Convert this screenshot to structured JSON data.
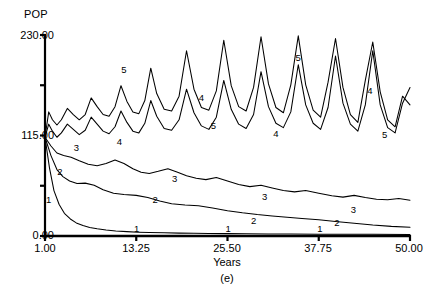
{
  "chart_data": {
    "type": "line",
    "title": "",
    "xlabel": "Years",
    "ylabel": "POP",
    "caption": "(e)",
    "xlim": [
      1.0,
      50.0
    ],
    "ylim": [
      0.0,
      230.0
    ],
    "grid": false,
    "legend_position": "inline-curve-labels",
    "xticks": [
      1.0,
      13.25,
      25.5,
      37.75,
      50.0
    ],
    "xtick_labels": [
      "1.00",
      "13.25",
      "25.50",
      "37.75",
      "50.00"
    ],
    "yticks": [
      0.0,
      57.5,
      115.0,
      172.5,
      230.0
    ],
    "ytick_labels": [
      "0.00",
      "",
      "115.00",
      "",
      "230.00"
    ],
    "ytick_labels_shown": [
      "0.00",
      "115.00",
      "230.00"
    ],
    "series": [
      {
        "name": "1",
        "label": "1",
        "x": [
          1.0,
          1.6,
          2.2,
          2.9,
          3.6,
          4.4,
          5.2,
          6.1,
          7.0,
          8.0,
          9.2,
          10.5,
          12.0,
          13.5,
          15.0,
          17.0,
          19.0,
          21.0,
          23.0,
          25.5,
          28.0,
          31.0,
          34.0,
          37.75,
          41.0,
          45.0,
          50.0
        ],
        "y": [
          113.0,
          78.0,
          52.0,
          36.0,
          26.0,
          19.5,
          15.0,
          12.0,
          9.8,
          8.2,
          6.8,
          5.8,
          5.0,
          4.4,
          4.0,
          3.6,
          3.3,
          3.1,
          2.9,
          2.7,
          2.5,
          2.4,
          2.2,
          2.1,
          2.0,
          1.9,
          1.8
        ]
      },
      {
        "name": "2",
        "label": "2",
        "x": [
          1.0,
          1.8,
          2.6,
          3.4,
          4.3,
          5.3,
          6.4,
          7.6,
          8.8,
          10.2,
          11.6,
          13.25,
          14.8,
          16.4,
          18.0,
          19.8,
          21.6,
          23.5,
          25.5,
          27.5,
          29.5,
          31.5,
          33.5,
          35.5,
          37.75,
          40.0,
          42.5,
          45.0,
          47.5,
          50.0
        ],
        "y": [
          113.0,
          92.0,
          76.0,
          68.0,
          63.0,
          60.0,
          60.5,
          58.0,
          53.0,
          49.0,
          47.5,
          46.5,
          44.0,
          40.0,
          37.0,
          35.5,
          34.5,
          32.0,
          29.0,
          26.5,
          24.5,
          23.0,
          21.5,
          20.0,
          18.5,
          16.5,
          14.5,
          12.5,
          11.0,
          10.0
        ]
      },
      {
        "name": "3",
        "label": "3",
        "x": [
          1.0,
          1.8,
          2.6,
          3.5,
          4.5,
          5.6,
          6.8,
          8.0,
          9.2,
          10.4,
          11.6,
          12.8,
          13.9,
          15.0,
          16.2,
          17.5,
          18.8,
          20.0,
          21.3,
          22.6,
          24.0,
          25.5,
          27.0,
          28.5,
          30.0,
          31.5,
          33.0,
          34.5,
          36.0,
          37.75,
          39.5,
          41.0,
          42.5,
          44.0,
          45.5,
          47.0,
          48.5,
          50.0
        ],
        "y": [
          113.0,
          103.0,
          95.0,
          92.0,
          90.0,
          86.0,
          82.0,
          80.5,
          83.0,
          87.0,
          83.0,
          77.0,
          73.0,
          71.5,
          74.0,
          77.0,
          73.0,
          69.0,
          66.0,
          64.5,
          67.0,
          63.0,
          59.0,
          56.5,
          58.0,
          55.0,
          52.0,
          50.5,
          52.0,
          49.0,
          46.0,
          44.5,
          46.5,
          44.0,
          42.0,
          41.5,
          43.0,
          41.0
        ]
      },
      {
        "name": "4",
        "label": "4",
        "x": [
          1.0,
          1.5,
          2.0,
          2.6,
          3.2,
          4.0,
          4.8,
          5.6,
          6.4,
          7.2,
          8.0,
          8.8,
          9.6,
          10.4,
          11.2,
          12.0,
          12.8,
          13.6,
          14.4,
          15.2,
          16.0,
          17.0,
          18.0,
          19.0,
          20.0,
          21.0,
          22.0,
          23.0,
          24.0,
          25.0,
          26.0,
          27.0,
          28.0,
          29.0,
          30.0,
          31.0,
          32.0,
          33.0,
          34.0,
          35.0,
          36.0,
          37.0,
          38.0,
          39.0,
          40.0,
          41.0,
          42.0,
          43.0,
          44.0,
          45.0,
          46.0,
          47.0,
          48.0,
          49.0,
          50.0
        ],
        "y": [
          113.0,
          128.0,
          120.0,
          113.0,
          118.0,
          128.0,
          122.0,
          116.0,
          121.0,
          136.0,
          128.0,
          120.0,
          117.0,
          125.0,
          143.0,
          130.0,
          120.0,
          118.0,
          129.0,
          155.0,
          137.0,
          123.0,
          121.0,
          133.0,
          168.0,
          141.0,
          126.0,
          122.0,
          136.0,
          178.0,
          145.0,
          128.0,
          123.0,
          139.0,
          188.0,
          148.0,
          129.0,
          124.0,
          142.0,
          196.0,
          150.0,
          129.0,
          122.0,
          147.0,
          206.0,
          152.0,
          128.0,
          120.0,
          150.0,
          212.0,
          150.0,
          124.0,
          118.0,
          152.0,
          170.0
        ]
      },
      {
        "name": "5",
        "label": "5",
        "x": [
          1.0,
          1.5,
          2.0,
          2.6,
          3.2,
          4.0,
          4.8,
          5.6,
          6.4,
          7.2,
          8.0,
          8.8,
          9.6,
          10.4,
          11.2,
          12.0,
          12.8,
          13.6,
          14.4,
          15.2,
          16.0,
          17.0,
          18.0,
          19.0,
          20.0,
          21.0,
          22.0,
          23.0,
          24.0,
          25.0,
          26.0,
          27.0,
          28.0,
          29.0,
          30.0,
          31.0,
          32.0,
          33.0,
          34.0,
          35.0,
          36.0,
          37.0,
          38.0,
          39.0,
          40.0,
          41.0,
          42.0,
          43.0,
          44.0,
          45.0,
          46.0,
          47.0,
          48.0,
          49.0,
          50.0
        ],
        "y": [
          113.0,
          142.0,
          133.0,
          127.0,
          133.0,
          146.0,
          139.0,
          133.0,
          139.0,
          158.0,
          148.0,
          139.0,
          137.0,
          148.0,
          172.0,
          154.0,
          142.0,
          140.0,
          155.0,
          192.0,
          163.0,
          145.0,
          143.0,
          160.0,
          212.0,
          168.0,
          147.0,
          144.0,
          166.0,
          224.0,
          172.0,
          148.0,
          143.0,
          170.0,
          228.0,
          174.0,
          147.0,
          141.0,
          173.0,
          229.0,
          173.0,
          144.0,
          136.0,
          176.0,
          226.0,
          170.0,
          139.0,
          130.0,
          178.0,
          222.0,
          165.0,
          133.0,
          125.0,
          160.0,
          150.0
        ]
      }
    ],
    "curve_tags": [
      {
        "label": "1",
        "x": 1.5,
        "y": 38.0
      },
      {
        "label": "2",
        "x": 3.0,
        "y": 70.0
      },
      {
        "label": "3",
        "x": 5.2,
        "y": 97.0
      },
      {
        "label": "2",
        "x": 15.8,
        "y": 38.0
      },
      {
        "label": "3",
        "x": 18.4,
        "y": 62.0
      },
      {
        "label": "2",
        "x": 29.0,
        "y": 14.0
      },
      {
        "label": "3",
        "x": 30.5,
        "y": 41.0
      },
      {
        "label": "2",
        "x": 40.2,
        "y": 11.0
      },
      {
        "label": "3",
        "x": 42.4,
        "y": 26.0
      },
      {
        "label": "1",
        "x": 13.3,
        "y": 5.0
      },
      {
        "label": "1",
        "x": 25.6,
        "y": 5.0
      },
      {
        "label": "1",
        "x": 37.9,
        "y": 5.0
      },
      {
        "label": "4",
        "x": 11.0,
        "y": 104.0
      },
      {
        "label": "5",
        "x": 11.6,
        "y": 186.0
      },
      {
        "label": "4",
        "x": 22.0,
        "y": 154.0
      },
      {
        "label": "5",
        "x": 23.6,
        "y": 122.0
      },
      {
        "label": "4",
        "x": 32.0,
        "y": 113.0
      },
      {
        "label": "5",
        "x": 35.0,
        "y": 200.0
      },
      {
        "label": "4",
        "x": 44.6,
        "y": 162.0
      },
      {
        "label": "5",
        "x": 46.6,
        "y": 112.0
      }
    ]
  },
  "axis_labels": {
    "y_axis_name": "POP",
    "x_axis_name": "Years",
    "figure_caption": "(e)",
    "y_top": "230.00",
    "y_mid": "115.00",
    "y_bottom": "0.00",
    "x_tick_1": "1.00",
    "x_tick_2": "13.25",
    "x_tick_3": "25.50",
    "x_tick_4": "37.75",
    "x_tick_5": "50.00"
  }
}
